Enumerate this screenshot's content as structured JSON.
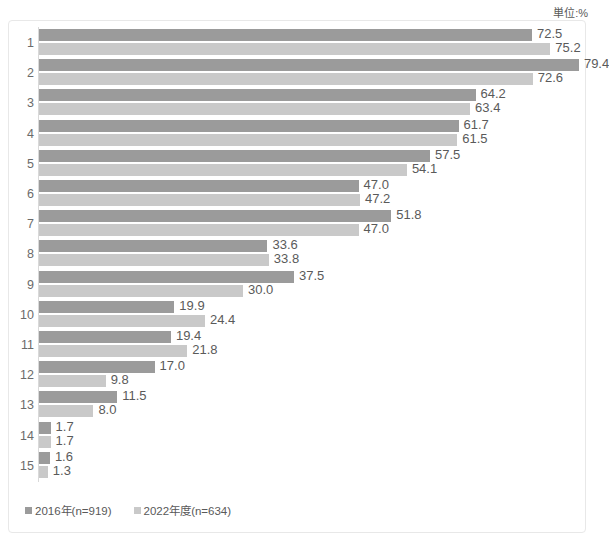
{
  "unit_note": "単位:%",
  "legend": {
    "position": "bottom-left",
    "entries": [
      {
        "label": "2016年(n=919)",
        "color": "#9b9b9b",
        "key": "series-a"
      },
      {
        "label": "2022年度(n=634)",
        "color": "#c9c9c9",
        "key": "series-b"
      }
    ]
  },
  "chart_data": {
    "type": "bar",
    "orientation": "horizontal",
    "title": "",
    "subtitle": "",
    "xlabel": "",
    "ylabel": "",
    "unit": "%",
    "unit_note": "単位:%",
    "grid": false,
    "legend_position": "bottom-left",
    "xlim": [
      0,
      79.4
    ],
    "px_per_unit": 6.8,
    "categories": [
      "1",
      "2",
      "3",
      "4",
      "5",
      "6",
      "7",
      "8",
      "9",
      "10",
      "11",
      "12",
      "13",
      "14",
      "15"
    ],
    "series": [
      {
        "name": "2016年(n=919)",
        "color": "#9b9b9b",
        "n": 919,
        "values": [
          72.5,
          79.4,
          64.2,
          61.7,
          57.5,
          47.0,
          51.8,
          33.6,
          37.5,
          19.9,
          19.4,
          17.0,
          11.5,
          1.7,
          1.6
        ],
        "labels": [
          "72.5",
          "79.4",
          "64.2",
          "61.7",
          "57.5",
          "47.0",
          "51.8",
          "33.6",
          "37.5",
          "19.9",
          "19.4",
          "17.0",
          "11.5",
          "1.7",
          "1.6"
        ]
      },
      {
        "name": "2022年度(n=634)",
        "color": "#c9c9c9",
        "n": 634,
        "values": [
          75.2,
          72.6,
          63.4,
          61.5,
          54.1,
          47.2,
          47.0,
          33.8,
          30.0,
          24.4,
          21.8,
          9.8,
          8.0,
          1.7,
          1.3
        ],
        "labels": [
          "75.2",
          "72.6",
          "63.4",
          "61.5",
          "54.1",
          "47.2",
          "47.0",
          "33.8",
          "30.0",
          "24.4",
          "21.8",
          "9.8",
          "8.0",
          "1.7",
          "1.3"
        ]
      }
    ]
  }
}
